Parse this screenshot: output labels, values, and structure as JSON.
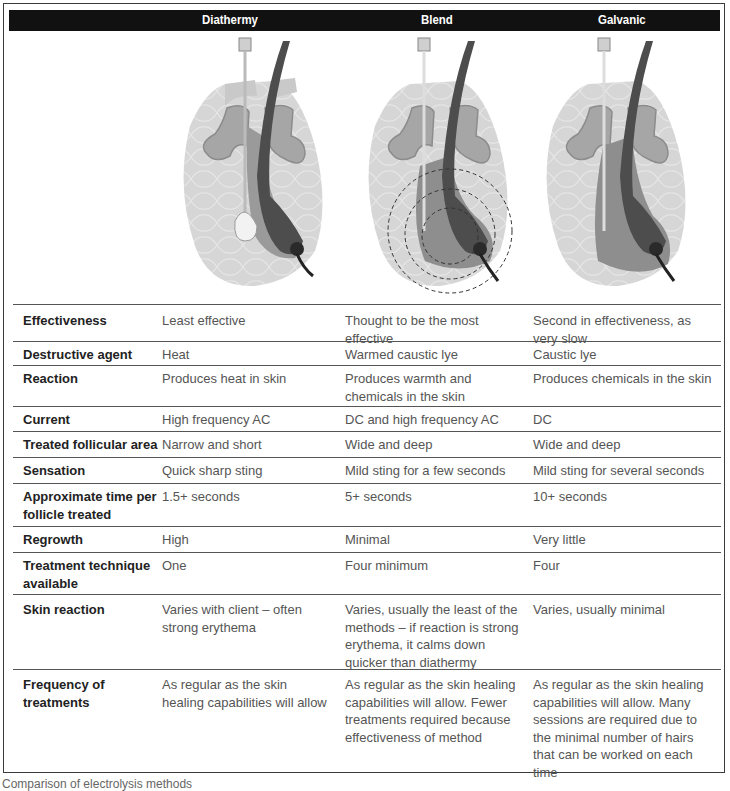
{
  "header": {
    "columns": [
      "Diathermy",
      "Blend",
      "Galvanic"
    ]
  },
  "illustrations": [
    {
      "name": "Diathermy",
      "icon": "hair-follicle-diathermy-illustration"
    },
    {
      "name": "Blend",
      "icon": "hair-follicle-blend-illustration"
    },
    {
      "name": "Galvanic",
      "icon": "hair-follicle-galvanic-illustration"
    }
  ],
  "rows": [
    {
      "label": "Effectiveness",
      "diathermy": "Least effective",
      "blend": "Thought to be the most effective",
      "galvanic": "Second in effectiveness, as very slow"
    },
    {
      "label": "Destructive agent",
      "diathermy": "Heat",
      "blend": "Warmed caustic lye",
      "galvanic": "Caustic lye"
    },
    {
      "label": "Reaction",
      "diathermy": "Produces heat in skin",
      "blend": "Produces warmth and chemicals in the skin",
      "galvanic": "Produces chemicals in the skin"
    },
    {
      "label": "Current",
      "diathermy": "High frequency AC",
      "blend": "DC and high frequency AC",
      "galvanic": "DC"
    },
    {
      "label": "Treated follicular area",
      "diathermy": "Narrow and short",
      "blend": "Wide and deep",
      "galvanic": "Wide and deep"
    },
    {
      "label": "Sensation",
      "diathermy": "Quick sharp sting",
      "blend": "Mild sting for a few seconds",
      "galvanic": "Mild sting for several seconds"
    },
    {
      "label": "Approximate time per follicle treated",
      "diathermy": "1.5+ seconds",
      "blend": "5+ seconds",
      "galvanic": "10+ seconds"
    },
    {
      "label": "Regrowth",
      "diathermy": "High",
      "blend": "Minimal",
      "galvanic": "Very little"
    },
    {
      "label": "Treatment technique available",
      "diathermy": "One",
      "blend": "Four minimum",
      "galvanic": "Four"
    },
    {
      "label": "Skin reaction",
      "diathermy": "Varies with client – often strong erythema",
      "blend": "Varies, usually the least of the methods – if reaction is strong erythema, it calms down quicker than diathermy",
      "galvanic": "Varies, usually minimal"
    },
    {
      "label": "Frequency of treatments",
      "diathermy": "As regular as the skin healing capabilities will allow",
      "blend": "As regular as the skin healing capabilities will allow. Fewer treatments required because effectiveness of method",
      "galvanic": "As regular as the skin healing capabilities will allow. Many sessions are required due to the minimal number of hairs that can be worked on each time"
    }
  ],
  "caption": "Comparison of electrolysis methods"
}
